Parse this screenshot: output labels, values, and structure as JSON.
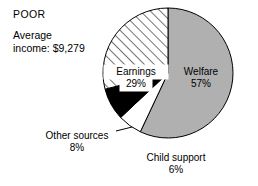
{
  "header": {
    "group_title": "POOR",
    "average_income_label": "Average",
    "average_income_value": "income: $9,279"
  },
  "chart_data": {
    "type": "pie",
    "title": "POOR",
    "subtitle": "Average income: $9,279",
    "xlabel": "",
    "ylabel": "",
    "units": "percent",
    "start_angle_deg": 0,
    "direction": "clockwise",
    "total": 100,
    "categories": [
      "Welfare",
      "Child support",
      "Other sources",
      "Earnings"
    ],
    "values": [
      57,
      6,
      8,
      29
    ],
    "labels_inside": [
      "Welfare",
      "Earnings"
    ],
    "labels_outside": [
      "Child support",
      "Other sources"
    ],
    "slices": [
      {
        "name": "Welfare",
        "value": 57,
        "value_text": "57%",
        "fill": "#b0b0b0",
        "pattern": "solid",
        "label_placement": "inside",
        "start_deg": 0,
        "end_deg": 205.2
      },
      {
        "name": "Child support",
        "value": 6,
        "value_text": "6%",
        "fill": "#ffffff",
        "pattern": "solid",
        "label_placement": "outside",
        "start_deg": 205.2,
        "end_deg": 226.8
      },
      {
        "name": "Other sources",
        "value": 8,
        "value_text": "8%",
        "fill": "#000000",
        "pattern": "solid",
        "label_placement": "outside",
        "start_deg": 226.8,
        "end_deg": 255.6
      },
      {
        "name": "Earnings",
        "value": 29,
        "value_text": "29%",
        "fill": "#ffffff",
        "pattern": "diagonal-hatch",
        "label_placement": "inside",
        "start_deg": 255.6,
        "end_deg": 360
      }
    ],
    "colors": {
      "welfare": "#b0b0b0",
      "child_support": "#ffffff",
      "other_sources": "#000000",
      "earnings_hatch": "#000000",
      "outline": "#000000",
      "background": "#ffffff",
      "text": "#000000"
    },
    "legend": "none",
    "grid": false
  }
}
